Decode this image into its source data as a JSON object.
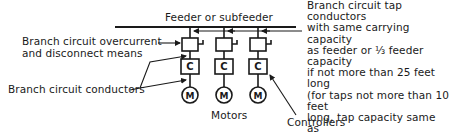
{
  "diagram": {
    "title": "Feeder or subfeeder",
    "labels": {
      "overcurrent": "Branch circuit overcurrent\nand disconnect means",
      "branch_conductors": "Branch circuit conductors",
      "tap_conductors": "Branch circuit tap conductors\nwith same carrying capacity\nas feeder or ⅓ feeder capacity\nif not more than 25 feet long\n(for taps not more than 10 feet\nlong, tap capacity same as\nbranch circuit conductors)",
      "motors": "Motors",
      "controllers": "Controllers"
    },
    "components": {
      "controller_symbol": "C",
      "motor_symbol": "M"
    },
    "branches": [
      {
        "id": 1,
        "controller": "C",
        "motor": "M"
      },
      {
        "id": 2,
        "controller": "C",
        "motor": "M"
      },
      {
        "id": 3,
        "controller": "C",
        "motor": "M"
      }
    ],
    "colors": {
      "ink": "#1a1a1a",
      "background": "#ffffff"
    }
  }
}
